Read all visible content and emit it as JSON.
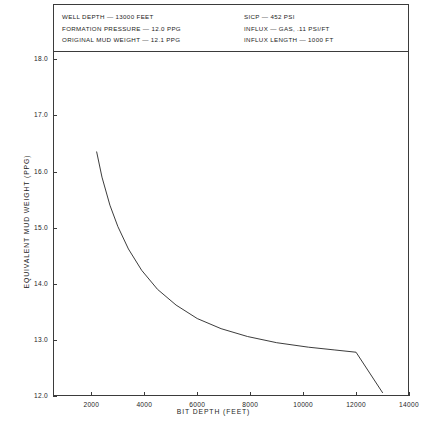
{
  "header": {
    "left_column": [
      "WELL DEPTH — 13000 FEET",
      "FORMATION PRESSURE — 12.0 PPG",
      "ORIGINAL MUD WEIGHT — 12.1 PPG"
    ],
    "right_column": [
      "SICP — 452 PSI",
      "INFLUX — GAS, .11 PSI/FT",
      "INFLUX LENGTH — 1000 FT"
    ]
  },
  "axes": {
    "x_title": "BIT DEPTH (FEET)",
    "y_title": "EQUIVALENT MUD WEIGHT (PPG)",
    "x_ticks": [
      "2000",
      "4000",
      "6000",
      "8000",
      "10000",
      "12000",
      "14000"
    ],
    "y_ticks": [
      "12.0",
      "13.0",
      "14.0",
      "15.0",
      "16.0",
      "17.0",
      "18.0"
    ]
  },
  "colors": {
    "line": "#262626",
    "frame": "#3b3b3b",
    "background": "#ffffff"
  },
  "chart_data": {
    "type": "line",
    "title": "",
    "xlabel": "BIT DEPTH (FEET)",
    "ylabel": "EQUIVALENT MUD WEIGHT (PPG)",
    "xlim": [
      550,
      14000
    ],
    "ylim": [
      12.0,
      18.13
    ],
    "xticks": [
      2000,
      4000,
      6000,
      8000,
      10000,
      12000,
      14000
    ],
    "yticks": [
      12.0,
      13.0,
      14.0,
      15.0,
      16.0,
      17.0,
      18.0
    ],
    "grid": false,
    "legend": null,
    "series": [
      {
        "name": "Equivalent mud weight during gas kick circulation",
        "x": [
          2200,
          2400,
          2700,
          3000,
          3400,
          3900,
          4500,
          5200,
          6000,
          6900,
          7900,
          9000,
          10200,
          11200,
          12000,
          13000
        ],
        "y": [
          16.35,
          15.9,
          15.4,
          15.02,
          14.62,
          14.24,
          13.9,
          13.62,
          13.38,
          13.2,
          13.06,
          12.95,
          12.87,
          12.82,
          12.78,
          12.06
        ]
      }
    ],
    "annotations": [
      "WELL DEPTH — 13000 FEET",
      "FORMATION PRESSURE — 12.0 PPG",
      "ORIGINAL MUD WEIGHT — 12.1 PPG",
      "SICP — 452 PSI",
      "INFLUX — GAS, .11 PSI/FT",
      "INFLUX LENGTH — 1000 FT"
    ]
  }
}
